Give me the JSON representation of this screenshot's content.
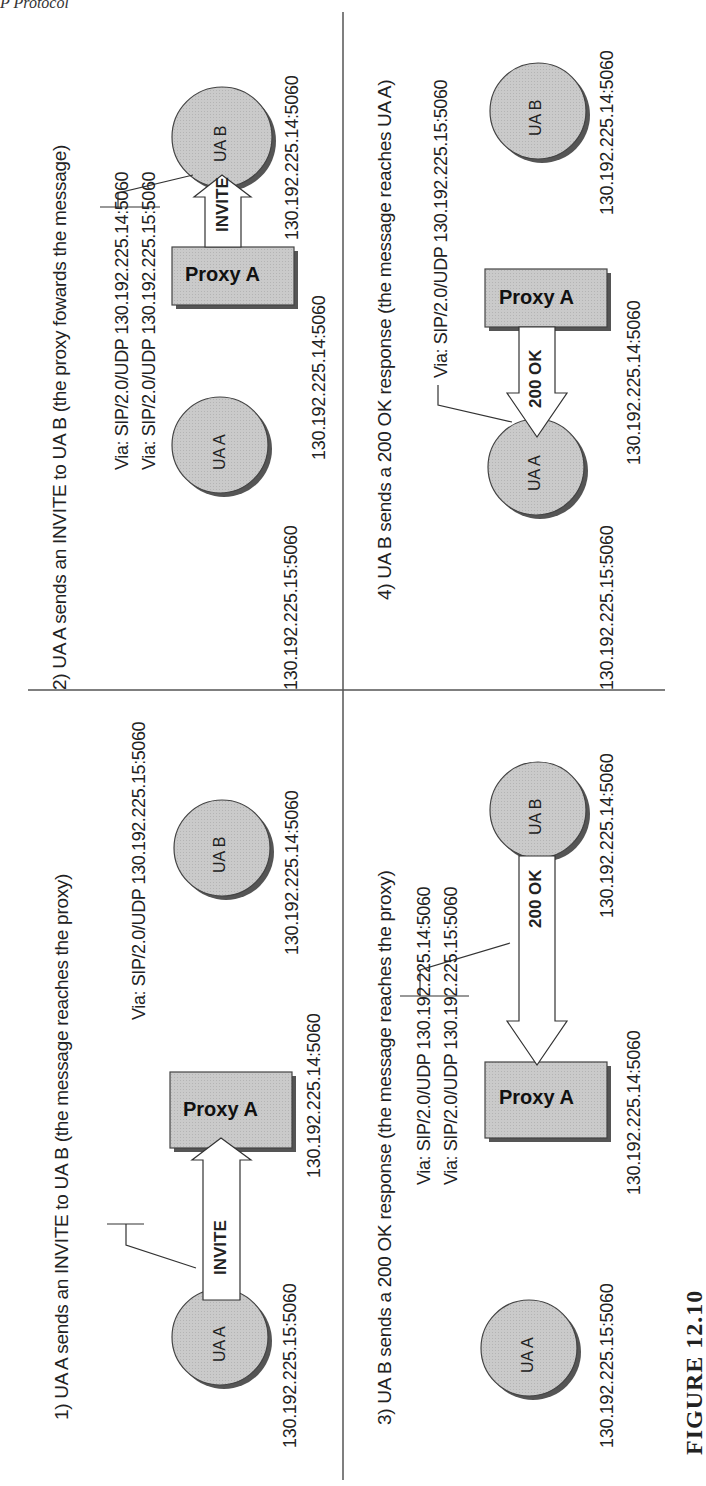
{
  "header": {
    "running_head": "P Protocol"
  },
  "colors": {
    "node_fill": "#c8c8c8",
    "node_stroke": "#444444",
    "shadow": "#555555",
    "line": "#333333",
    "arrow_fill": "#ffffff"
  },
  "caption": "FIGURE 12.10",
  "panels": [
    {
      "id": 1,
      "title": "1) UA A sends an INVITE to UA B (the message reaches the proxy)",
      "message": "INVITE",
      "via": [
        "Via: SIP/2.0/UDP 130.192.225.15:5060"
      ],
      "nodes": {
        "ua_a": {
          "label": "UA A",
          "ip": "130.192.225.15:5060"
        },
        "proxy": {
          "label": "Proxy A",
          "ip": "130.192.225.14:5060"
        },
        "ua_b": {
          "label": "UA B",
          "ip": "130.192.225.14:5060"
        }
      }
    },
    {
      "id": 2,
      "title": "2) UA A sends an INVITE to UA B (the proxy fowards the message)",
      "message": "INVITE",
      "via": [
        "Via: SIP/2.0/UDP 130.192.225.14:5060",
        "Via: SIP/2.0/UDP 130.192.225.15:5060"
      ],
      "nodes": {
        "ua_a": {
          "label": "UA A",
          "ip": "130.192.225.15:5060"
        },
        "proxy": {
          "label": "Proxy A",
          "ip": "130.192.225.14:5060"
        },
        "ua_b": {
          "label": "UA B",
          "ip": "130.192.225.14:5060"
        }
      }
    },
    {
      "id": 3,
      "title": "3) UA B sends a 200 OK response (the message reaches the proxy)",
      "message": "200 OK",
      "via": [
        "Via: SIP/2.0/UDP 130.192.225.14:5060",
        "Via: SIP/2.0/UDP 130.192.225.15:5060"
      ],
      "nodes": {
        "ua_a": {
          "label": "UA A",
          "ip": "130.192.225.15:5060"
        },
        "proxy": {
          "label": "Proxy A",
          "ip": "130.192.225.14:5060"
        },
        "ua_b": {
          "label": "UA B",
          "ip": "130.192.225.14:5060"
        }
      }
    },
    {
      "id": 4,
      "title": "4) UA B sends a 200 OK response (the message reaches UA A)",
      "message": "200 OK",
      "via": [
        "Via: SIP/2.0/UDP 130.192.225.15:5060"
      ],
      "nodes": {
        "ua_a": {
          "label": "UA A",
          "ip": "130.192.225.15:5060"
        },
        "proxy": {
          "label": "Proxy A",
          "ip": "130.192.225.14:5060"
        },
        "ua_b": {
          "label": "UA B",
          "ip": "130.192.225.14:5060"
        }
      }
    }
  ]
}
